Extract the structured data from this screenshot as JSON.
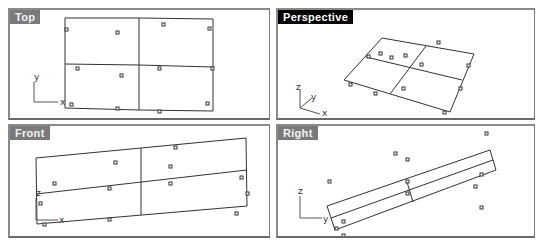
{
  "viewports": {
    "top": {
      "label": "Top",
      "active": false,
      "axes": {
        "h": "x",
        "v": "y"
      }
    },
    "perspective": {
      "label": "Perspective",
      "active": true,
      "axes": {
        "a": "z",
        "b": "y",
        "c": "x"
      }
    },
    "front": {
      "label": "Front",
      "active": false,
      "axes": {
        "h": "x",
        "v": "z"
      }
    },
    "right": {
      "label": "Right",
      "active": false,
      "axes": {
        "h": "y",
        "v": "z"
      }
    }
  },
  "colors": {
    "label_inactive_bg": "#7a7a7a",
    "label_active_bg": "#000000",
    "geometry_line": "#333333",
    "control_point": "#333333"
  }
}
